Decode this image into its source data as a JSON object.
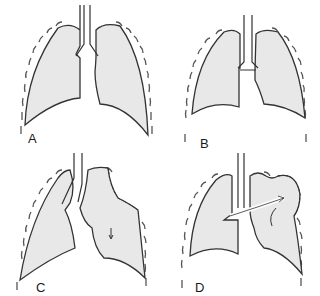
{
  "figure": {
    "panels": [
      {
        "label": "A",
        "description": "Normal lungs"
      },
      {
        "label": "B",
        "description": "Bilateral collapse, mediastinum midline"
      },
      {
        "label": "C",
        "description": "Left pneumothorax with mediastinal shift"
      },
      {
        "label": "D",
        "description": "Tension pneumothorax with airflow arrow"
      }
    ],
    "colors": {
      "lung_fill": "#e8e8e8",
      "outline": "#333333",
      "background": "#ffffff"
    }
  }
}
